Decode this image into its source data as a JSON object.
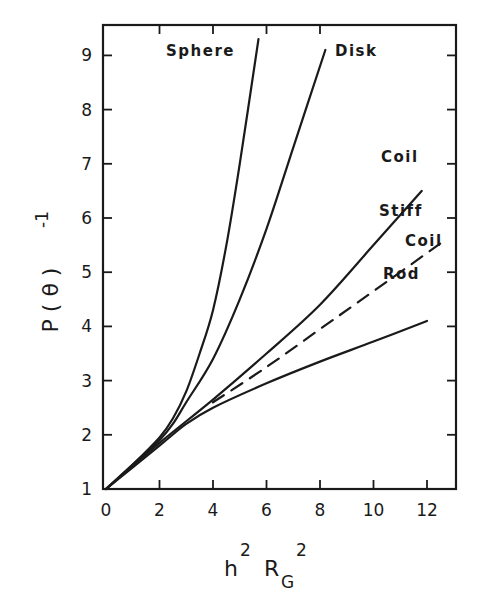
{
  "chart_data": {
    "type": "line",
    "title": "",
    "xlabel": "h² R_G²",
    "ylabel": "P(θ)⁻¹",
    "xlim": [
      0,
      13
    ],
    "ylim": [
      1,
      9.7
    ],
    "x_ticks": [
      0,
      2,
      4,
      6,
      8,
      10,
      12
    ],
    "y_ticks": [
      1,
      2,
      3,
      4,
      5,
      6,
      7,
      8,
      9
    ],
    "grid": false,
    "legend": "inline labels at curve ends",
    "series": [
      {
        "name": "Sphere",
        "style": "solid",
        "points": [
          [
            0,
            1
          ],
          [
            1,
            1.45
          ],
          [
            2,
            1.95
          ],
          [
            2.5,
            2.3
          ],
          [
            3,
            2.8
          ],
          [
            3.5,
            3.5
          ],
          [
            4,
            4.3
          ],
          [
            4.5,
            5.5
          ],
          [
            5,
            7
          ],
          [
            5.7,
            9.3
          ]
        ]
      },
      {
        "name": "Disk",
        "style": "solid",
        "points": [
          [
            0,
            1
          ],
          [
            1,
            1.45
          ],
          [
            2,
            1.9
          ],
          [
            2.5,
            2.2
          ],
          [
            3,
            2.6
          ],
          [
            4,
            3.4
          ],
          [
            5,
            4.5
          ],
          [
            6,
            5.8
          ],
          [
            7,
            7.3
          ],
          [
            8.2,
            9.1
          ]
        ]
      },
      {
        "name": "Coil",
        "style": "solid",
        "points": [
          [
            0,
            1
          ],
          [
            2,
            1.85
          ],
          [
            4,
            2.65
          ],
          [
            6,
            3.5
          ],
          [
            8,
            4.4
          ],
          [
            10,
            5.5
          ],
          [
            11.8,
            6.5
          ]
        ]
      },
      {
        "name": "Stiff Coil",
        "style": "dashed",
        "points": [
          [
            4,
            2.6
          ],
          [
            6,
            3.25
          ],
          [
            8,
            3.95
          ],
          [
            10,
            4.65
          ],
          [
            12.7,
            5.6
          ]
        ]
      },
      {
        "name": "Rod",
        "style": "solid",
        "points": [
          [
            0,
            1
          ],
          [
            2,
            1.8
          ],
          [
            3,
            2.2
          ],
          [
            4,
            2.5
          ],
          [
            6,
            2.95
          ],
          [
            8,
            3.35
          ],
          [
            10,
            3.72
          ],
          [
            12,
            4.1
          ]
        ]
      }
    ]
  },
  "labels": {
    "sphere": "Sphere",
    "disk": "Disk",
    "coil": "Coil",
    "stiff": "Stiff",
    "stiff_coil": "Coil",
    "rod": "Rod"
  },
  "axes": {
    "x_tick_labels": [
      "0",
      "2",
      "4",
      "6",
      "8",
      "10",
      "12"
    ],
    "y_tick_labels": [
      "1",
      "2",
      "3",
      "4",
      "5",
      "6",
      "7",
      "8",
      "9"
    ],
    "xlabel_main": "h",
    "xlabel_sup1": "2",
    "xlabel_R": "R",
    "xlabel_sub": "G",
    "xlabel_sup2": "2",
    "ylabel_main": "P ( θ )",
    "ylabel_sup": "-1"
  },
  "colors": {
    "ink": "#1a1a1a",
    "background": "#ffffff"
  }
}
